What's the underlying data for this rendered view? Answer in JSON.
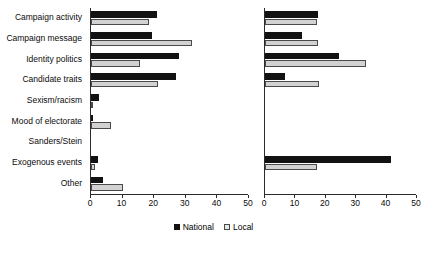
{
  "chart_data": {
    "type": "bar",
    "orientation": "horizontal",
    "title": "",
    "xlabel": "",
    "ylabel": "",
    "grid": false,
    "legend_position": "bottom-center",
    "categories": [
      "Campaign activity",
      "Campaign message",
      "Identity politics",
      "Candidate traits",
      "Sexism/racism",
      "Mood of electorate",
      "Sanders/Stein",
      "Exogenous events",
      "Other"
    ],
    "panels": [
      {
        "name": "left-panel",
        "xlim": [
          0,
          50
        ],
        "xticks": [
          0,
          10,
          20,
          30,
          40,
          50
        ],
        "series": [
          {
            "name": "National",
            "color": "#121212",
            "values": [
              21,
              19.4,
              27.7,
              27,
              2.5,
              0.5,
              0,
              2.3,
              3.8
            ]
          },
          {
            "name": "Local",
            "color": "#d2d2d2",
            "values": [
              18.5,
              32,
              15.6,
              21.3,
              0.5,
              6.4,
              0,
              1.4,
              10
            ]
          }
        ]
      },
      {
        "name": "right-panel",
        "xlim": [
          0,
          50
        ],
        "xticks": [
          0,
          10,
          20,
          30,
          40,
          50
        ],
        "series": [
          {
            "name": "National",
            "color": "#121212",
            "values": [
              17.5,
              12.3,
              24.3,
              6.6,
              0,
              0,
              0,
              41.5,
              0
            ]
          },
          {
            "name": "Local",
            "color": "#d2d2d2",
            "values": [
              17,
              17.3,
              33.3,
              17.7,
              0,
              0,
              0,
              17,
              0
            ]
          }
        ]
      }
    ],
    "legend": [
      {
        "label": "National",
        "swatch": "filled-square-black"
      },
      {
        "label": "Local",
        "swatch": "open-square-light"
      }
    ]
  }
}
